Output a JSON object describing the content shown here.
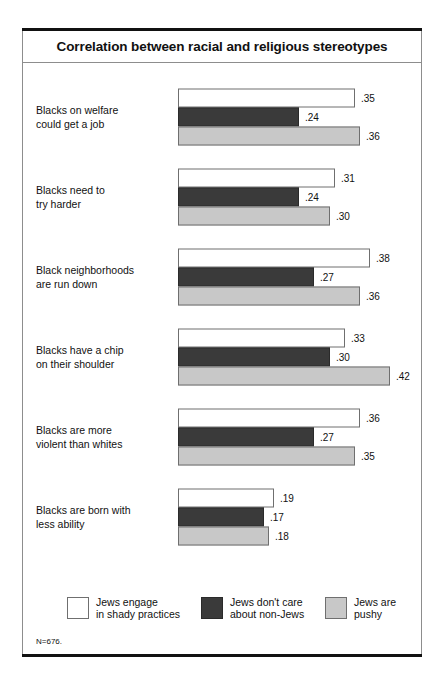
{
  "figure": {
    "title": "Correlation between racial and religious stereotypes",
    "footnote": "N=676."
  },
  "legend": {
    "items": [
      {
        "label": "Jews engage\nin shady practices",
        "color": "#ffffff",
        "swatch_name": "legend-swatch-shady-practices"
      },
      {
        "label": "Jews don't care\nabout non-Jews",
        "color": "#3a3a3a",
        "swatch_name": "legend-swatch-dont-care"
      },
      {
        "label": "Jews are\npushy",
        "color": "#c8c8c8",
        "swatch_name": "legend-swatch-pushy"
      }
    ]
  },
  "chart_data": {
    "type": "bar",
    "orientation": "horizontal",
    "title": "Correlation between racial and religious stereotypes",
    "xlabel": "",
    "ylabel": "",
    "xlim": [
      0,
      0.42
    ],
    "grid": false,
    "legend_position": "bottom",
    "note": "N=676.",
    "categories": [
      "Blacks on welfare could get a job",
      "Blacks need to try harder",
      "Black neighborhoods are run down",
      "Blacks have a chip on their shoulder",
      "Blacks are more violent than whites",
      "Blacks are born with less ability"
    ],
    "category_lines": [
      [
        "Blacks on welfare",
        "could get a job"
      ],
      [
        "Blacks need to",
        "try harder"
      ],
      [
        "Black neighborhoods",
        "are run down"
      ],
      [
        "Blacks have a chip",
        "on their shoulder"
      ],
      [
        "Blacks are more",
        "violent than whites"
      ],
      [
        "Blacks are born with",
        "less ability"
      ]
    ],
    "series": [
      {
        "name": "Jews engage in shady practices",
        "color": "#ffffff",
        "values": [
          0.35,
          0.31,
          0.38,
          0.33,
          0.36,
          0.19
        ],
        "labels": [
          ".35",
          ".31",
          ".38",
          ".33",
          ".36",
          ".19"
        ]
      },
      {
        "name": "Jews don't care about non-Jews",
        "color": "#3a3a3a",
        "values": [
          0.24,
          0.24,
          0.27,
          0.3,
          0.27,
          0.17
        ],
        "labels": [
          ".24",
          ".24",
          ".27",
          ".30",
          ".27",
          ".17"
        ]
      },
      {
        "name": "Jews are pushy",
        "color": "#c8c8c8",
        "values": [
          0.36,
          0.3,
          0.36,
          0.42,
          0.35,
          0.18
        ],
        "labels": [
          ".36",
          ".30",
          ".36",
          ".42",
          ".35",
          ".18"
        ]
      }
    ]
  }
}
